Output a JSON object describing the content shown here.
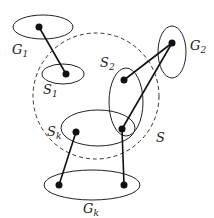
{
  "labels": {
    "G1": "G",
    "G1_sub": "1",
    "S1": "S",
    "S1_sub": "1",
    "G2": "G",
    "G2_sub": "2",
    "S2": "S",
    "S2_sub": "2",
    "Sk": "S",
    "Sk_sub": "k",
    "Gk": "G",
    "Gk_sub": "k",
    "S": "S"
  },
  "colors": {
    "stroke": "#222222",
    "background": "#ffffff"
  }
}
